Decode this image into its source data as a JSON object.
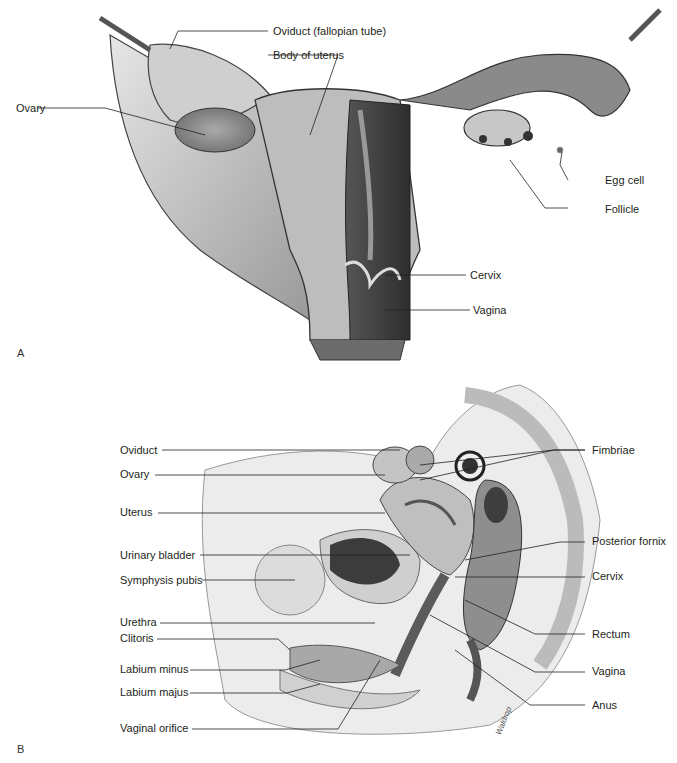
{
  "figure": {
    "panel_a": {
      "letter": "A",
      "title": "Female reproductive organs, posterior view",
      "labels": [
        {
          "id": "oviduct",
          "text": "Oviduct (fallopian tube)"
        },
        {
          "id": "body-of-uterus",
          "text": "Body of uterus"
        },
        {
          "id": "ovary",
          "text": "Ovary"
        },
        {
          "id": "egg-cell",
          "text": "Egg cell"
        },
        {
          "id": "follicle",
          "text": "Follicle"
        },
        {
          "id": "cervix",
          "text": "Cervix"
        },
        {
          "id": "vagina",
          "text": "Vagina"
        }
      ]
    },
    "panel_b": {
      "letter": "B",
      "title": "Female pelvis, sagittal section",
      "labels_left": [
        {
          "id": "oviduct",
          "text": "Oviduct"
        },
        {
          "id": "ovary",
          "text": "Ovary"
        },
        {
          "id": "uterus",
          "text": "Uterus"
        },
        {
          "id": "urinary-bladder",
          "text": "Urinary bladder"
        },
        {
          "id": "symphysis-pubis",
          "text": "Symphysis pubis"
        },
        {
          "id": "urethra",
          "text": "Urethra"
        },
        {
          "id": "clitoris",
          "text": "Clitoris"
        },
        {
          "id": "labium-minus",
          "text": "Labium minus"
        },
        {
          "id": "labium-majus",
          "text": "Labium majus"
        },
        {
          "id": "vaginal-orifice",
          "text": "Vaginal orifice"
        }
      ],
      "labels_right": [
        {
          "id": "fimbriae",
          "text": "Fimbriae"
        },
        {
          "id": "posterior-fornix",
          "text": "Posterior fornix"
        },
        {
          "id": "cervix",
          "text": "Cervix"
        },
        {
          "id": "rectum",
          "text": "Rectum"
        },
        {
          "id": "vagina",
          "text": "Vagina"
        },
        {
          "id": "anus",
          "text": "Anus"
        }
      ],
      "artist_signature": "Waldrop"
    }
  }
}
